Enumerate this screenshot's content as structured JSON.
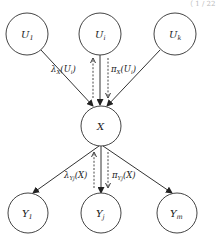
{
  "corner_fragment": "（ 1 / 22",
  "nodes": {
    "U1": {
      "base": "U",
      "sub": "1",
      "cx": 27,
      "cy": 34,
      "r": 21
    },
    "Ui": {
      "base": "U",
      "sub": "i",
      "cx": 100,
      "cy": 34,
      "r": 21
    },
    "Uk": {
      "base": "U",
      "sub": "k",
      "cx": 175,
      "cy": 34,
      "r": 21
    },
    "X": {
      "base": "X",
      "sub": "",
      "cx": 101,
      "cy": 126,
      "r": 20
    },
    "Y1": {
      "base": "Y",
      "sub": "1",
      "cx": 28,
      "cy": 213,
      "r": 20
    },
    "Yj": {
      "base": "Y",
      "sub": "j",
      "cx": 101,
      "cy": 213,
      "r": 20
    },
    "Ym": {
      "base": "Y",
      "sub": "m",
      "cx": 177,
      "cy": 213,
      "r": 20
    }
  },
  "edges": [
    {
      "from": "U1",
      "to": "X"
    },
    {
      "from": "Ui",
      "to": "X"
    },
    {
      "from": "Uk",
      "to": "X"
    },
    {
      "from": "X",
      "to": "Y1"
    },
    {
      "from": "X",
      "to": "Yj"
    },
    {
      "from": "X",
      "to": "Ym"
    }
  ],
  "messages": {
    "lambda_x_ui": {
      "sym": "λ",
      "sub": "X",
      "arg": "(U",
      "argsub": "i",
      "close": ")",
      "direction": "up"
    },
    "pi_x_ui": {
      "sym": "π",
      "sub": "X",
      "arg": "(U",
      "argsub": "i",
      "close": ")",
      "direction": "down"
    },
    "lambda_yj_x": {
      "sym": "λ",
      "sub": "Yj",
      "arg": "(X)",
      "argsub": "",
      "close": "",
      "direction": "up"
    },
    "pi_yj_x": {
      "sym": "π",
      "sub": "Yj",
      "arg": "(X)",
      "argsub": "",
      "close": "",
      "direction": "down"
    }
  }
}
